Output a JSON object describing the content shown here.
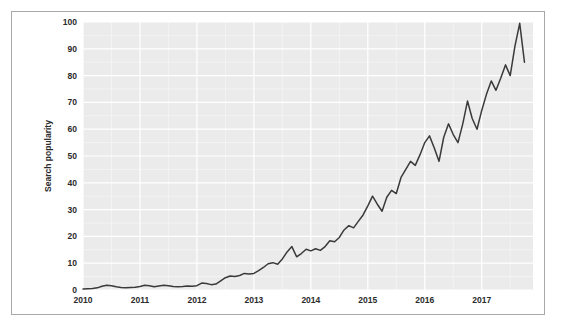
{
  "chart_data": {
    "type": "line",
    "title": "",
    "subtitle": "",
    "xlabel": "",
    "ylabel": "Search popularity",
    "xlim": [
      2010.0,
      2017.9
    ],
    "ylim": [
      0,
      100
    ],
    "grid": true,
    "legend": null,
    "legend_position": "none",
    "x_tick_labels": [
      "2010",
      "2011",
      "2012",
      "2013",
      "2014",
      "2015",
      "2016",
      "2017"
    ],
    "x_tick_values": [
      2010,
      2011,
      2012,
      2013,
      2014,
      2015,
      2016,
      2017
    ],
    "y_tick_labels": [
      "0",
      "10",
      "20",
      "30",
      "40",
      "50",
      "60",
      "70",
      "80",
      "90",
      "100"
    ],
    "y_tick_values": [
      0,
      10,
      20,
      30,
      40,
      50,
      60,
      70,
      80,
      90,
      100
    ],
    "series": [
      {
        "name": "Search popularity",
        "color": "#3a3a3a",
        "x": [
          2010.0,
          2010.083,
          2010.167,
          2010.25,
          2010.333,
          2010.417,
          2010.5,
          2010.583,
          2010.667,
          2010.75,
          2010.833,
          2010.917,
          2011.0,
          2011.083,
          2011.167,
          2011.25,
          2011.333,
          2011.417,
          2011.5,
          2011.583,
          2011.667,
          2011.75,
          2011.833,
          2011.917,
          2012.0,
          2012.083,
          2012.167,
          2012.25,
          2012.333,
          2012.417,
          2012.5,
          2012.583,
          2012.667,
          2012.75,
          2012.833,
          2012.917,
          2013.0,
          2013.083,
          2013.167,
          2013.25,
          2013.333,
          2013.417,
          2013.5,
          2013.583,
          2013.667,
          2013.75,
          2013.833,
          2013.917,
          2014.0,
          2014.083,
          2014.167,
          2014.25,
          2014.333,
          2014.417,
          2014.5,
          2014.583,
          2014.667,
          2014.75,
          2014.833,
          2014.917,
          2015.0,
          2015.083,
          2015.167,
          2015.25,
          2015.333,
          2015.417,
          2015.5,
          2015.583,
          2015.667,
          2015.75,
          2015.833,
          2015.917,
          2016.0,
          2016.083,
          2016.167,
          2016.25,
          2016.333,
          2016.417,
          2016.5,
          2016.583,
          2016.667,
          2016.75,
          2016.833,
          2016.917,
          2017.0,
          2017.083,
          2017.167,
          2017.25,
          2017.333,
          2017.417,
          2017.5,
          2017.583,
          2017.667,
          2017.75
        ],
        "values": [
          0.4,
          0.5,
          0.6,
          0.8,
          1.4,
          1.8,
          1.6,
          1.2,
          0.9,
          0.8,
          0.9,
          1.0,
          1.3,
          1.8,
          1.6,
          1.2,
          1.5,
          1.8,
          1.6,
          1.3,
          1.2,
          1.3,
          1.5,
          1.4,
          1.6,
          2.6,
          2.4,
          2.0,
          2.2,
          3.4,
          4.6,
          5.2,
          5.0,
          5.4,
          6.2,
          6.0,
          6.2,
          7.2,
          8.4,
          9.8,
          10.2,
          9.6,
          11.6,
          14.2,
          16.2,
          12.4,
          13.6,
          15.2,
          14.6,
          15.4,
          14.8,
          16.2,
          18.4,
          18.0,
          19.6,
          22.4,
          24.0,
          23.2,
          25.6,
          28.0,
          31.4,
          35.0,
          32.0,
          29.4,
          34.6,
          37.2,
          36.0,
          42.0,
          45.0,
          48.0,
          46.5,
          50.5,
          55.0,
          57.5,
          53.0,
          48.0,
          57.0,
          62.0,
          58.0,
          55.0,
          62.0,
          70.5,
          64.0,
          60.0,
          67.0,
          73.0,
          78.0,
          74.5,
          79.0,
          84.0,
          80.0,
          91.0,
          99.5,
          85.0
        ]
      }
    ]
  },
  "plot_geometry": {
    "panel_left": 82,
    "panel_top": 21,
    "panel_right": 532,
    "panel_bottom": 289,
    "panel_bg": "#ebebeb",
    "gridline_major": "#ffffff",
    "gridline_minor": "#f5f5f5",
    "frame_border": "#a8a8a8",
    "figure_bg": "#ffffff"
  }
}
